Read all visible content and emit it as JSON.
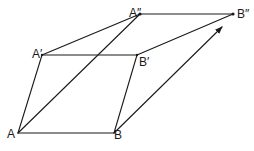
{
  "diagram": {
    "type": "geometric-vector-construction",
    "points": {
      "A": {
        "label": "A",
        "x": 18,
        "y": 133
      },
      "B": {
        "label": "B",
        "x": 114,
        "y": 133
      },
      "A1": {
        "label": "A′",
        "x": 42,
        "y": 55
      },
      "B1": {
        "label": "B′",
        "x": 137,
        "y": 55
      },
      "A2": {
        "label": "A″",
        "x": 140,
        "y": 14
      },
      "B2": {
        "label": "B″",
        "x": 233,
        "y": 14
      }
    },
    "segments": [
      {
        "from": "A",
        "to": "B"
      },
      {
        "from": "A",
        "to": "A1"
      },
      {
        "from": "B",
        "to": "B1"
      },
      {
        "from": "A1",
        "to": "B1"
      },
      {
        "from": "A1",
        "to": "A2"
      },
      {
        "from": "B1",
        "to": "B2"
      },
      {
        "from": "A2",
        "to": "B2"
      },
      {
        "from": "A",
        "to": "A2"
      }
    ],
    "arrows": [
      {
        "from": "B",
        "to": "B2",
        "tip": {
          "x": 222,
          "y": 27
        }
      }
    ],
    "colors": {
      "stroke": "#1a1a1a",
      "background": "#ffffff"
    }
  }
}
